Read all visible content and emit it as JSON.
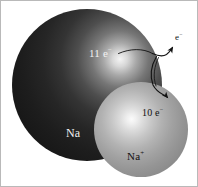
{
  "figure": {
    "width": 198,
    "height": 187,
    "background_color": "#ffffff",
    "border_color": "#b9b9b9"
  },
  "atom": {
    "name": "sodium-atom",
    "element_label": "Na",
    "electron_label": "11 e",
    "electron_charge_sign": "−",
    "electron_count": 11,
    "sphere": {
      "center_x": 86,
      "center_y": 84,
      "radius": 75,
      "fill_style": "dark-radial-gradient",
      "highlight_color": "#f4f4f4",
      "shadow_color": "#0d0d0d"
    }
  },
  "ion": {
    "name": "sodium-ion",
    "element_label": "Na",
    "element_charge_sign": "+",
    "electron_label": "10 e",
    "electron_charge_sign": "−",
    "electron_count": 10,
    "sphere": {
      "center_x": 140,
      "center_y": 128,
      "radius": 47,
      "fill_style": "light-radial-gradient",
      "highlight_color": "#fbfbfb",
      "shadow_color": "#7e7e7e"
    }
  },
  "released_electron": {
    "name": "free-electron",
    "label": "e",
    "charge_sign": "−"
  },
  "arrows": {
    "stroke_color": "#121212",
    "electron_release": {
      "name": "electron-release-arrow",
      "from": "11 e label on sodium atom",
      "to": "free electron"
    },
    "ion_formation": {
      "name": "ion-formation-arrow",
      "from": "sodium atom surface",
      "to": "sodium ion"
    }
  }
}
